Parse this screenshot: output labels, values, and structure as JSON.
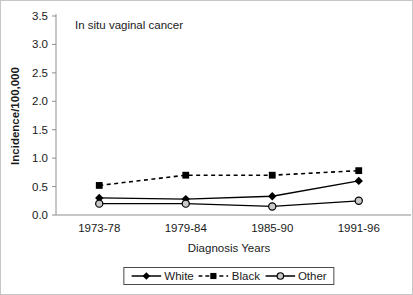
{
  "chart_data": {
    "type": "line",
    "title": "In situ vaginal cancer",
    "xlabel": "Diagnosis Years",
    "ylabel": "Incidence/100,000",
    "categories": [
      "1973-78",
      "1979-84",
      "1985-90",
      "1991-96"
    ],
    "ylim": [
      0,
      3.5
    ],
    "ytick_step": 0.5,
    "ytick_labels": [
      "0.0",
      "0.5",
      "1.0",
      "1.5",
      "2.0",
      "2.5",
      "3.0",
      "3.5"
    ],
    "grid": false,
    "legend_position": "bottom-center",
    "axis_color": "#8f8f8f",
    "text_color": "#1a1a1a",
    "series": [
      {
        "name": "White",
        "values": [
          0.3,
          0.28,
          0.33,
          0.6
        ],
        "line_style": "solid",
        "marker": "diamond",
        "color": "#000000",
        "marker_fill": "#000000"
      },
      {
        "name": "Black",
        "values": [
          0.52,
          0.7,
          0.7,
          0.78
        ],
        "line_style": "dashed",
        "marker": "square",
        "color": "#000000",
        "marker_fill": "#000000"
      },
      {
        "name": "Other",
        "values": [
          0.2,
          0.2,
          0.15,
          0.25
        ],
        "line_style": "solid",
        "marker": "circle",
        "color": "#000000",
        "marker_fill": "#c9c9c9"
      }
    ]
  }
}
